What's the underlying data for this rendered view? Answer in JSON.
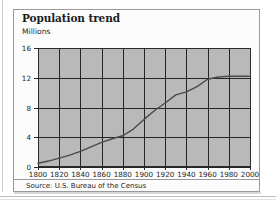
{
  "card": {
    "title": "Population trend",
    "unit_label": "Millions",
    "source": "Source: U.S. Bureau of the Census"
  },
  "colors": {
    "plot_background": "#b9b9b9",
    "grid": "#262626",
    "series_line": "#4a4a4a",
    "card_background": "#fcfcfc",
    "card_border": "#9a9a9a",
    "text": "#1b1b1b"
  },
  "chart_data": {
    "type": "line",
    "title": "Population trend",
    "xlabel": "",
    "ylabel": "Millions",
    "ylim": [
      0,
      16
    ],
    "xlim": [
      1800,
      2000
    ],
    "grid": true,
    "legend": "none",
    "yticks": [
      0,
      4,
      8,
      12,
      16
    ],
    "ytick_labels": [
      "0",
      "4",
      "8",
      "12",
      "16"
    ],
    "xticks": [
      1800,
      1820,
      1840,
      1860,
      1880,
      1900,
      1920,
      1940,
      1960,
      1980,
      2000
    ],
    "xtick_labels": [
      "1800",
      "1820",
      "1840",
      "1860",
      "1880",
      "1900",
      "1920",
      "1940",
      "1960",
      "1980",
      "2000"
    ],
    "x": [
      1800,
      1810,
      1820,
      1830,
      1840,
      1850,
      1860,
      1870,
      1880,
      1890,
      1900,
      1910,
      1920,
      1930,
      1940,
      1950,
      1960,
      1970,
      1980,
      1990,
      2000
    ],
    "series": [
      {
        "name": "Population",
        "values": [
          0.5,
          0.8,
          1.2,
          1.6,
          2.1,
          2.7,
          3.3,
          3.8,
          4.2,
          5.1,
          6.4,
          7.6,
          8.6,
          9.7,
          10.1,
          10.8,
          11.8,
          12.1,
          12.2,
          12.2,
          12.2
        ]
      }
    ]
  }
}
